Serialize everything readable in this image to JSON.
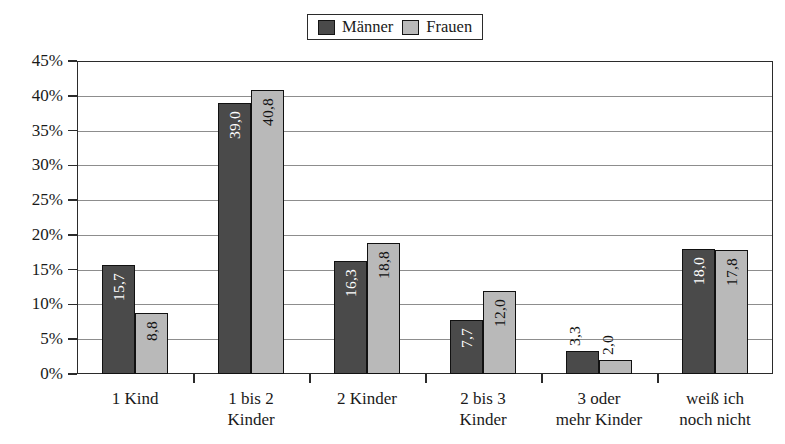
{
  "legend": {
    "entries": [
      {
        "label": "Männer",
        "color": "#4a4a4a"
      },
      {
        "label": "Frauen",
        "color": "#b9b9b9"
      }
    ]
  },
  "axis": {
    "y_ticks": [
      "0%",
      "5%",
      "10%",
      "15%",
      "20%",
      "25%",
      "30%",
      "35%",
      "40%",
      "45%"
    ]
  },
  "chart_data": {
    "type": "bar",
    "title": "",
    "xlabel": "",
    "ylabel": "",
    "ylim": [
      0,
      45
    ],
    "ytick_step": 5,
    "grid": true,
    "legend_position": "top-center",
    "value_format": "comma-decimal",
    "categories": [
      "1 Kind",
      "1 bis 2\nKinder",
      "2 Kinder",
      "2 bis 3\nKinder",
      "3 oder\nmehr Kinder",
      "weiß ich\nnoch nicht"
    ],
    "series": [
      {
        "name": "Männer",
        "color": "#4a4a4a",
        "values": [
          15.7,
          39.0,
          16.3,
          7.7,
          3.3,
          18.0
        ],
        "labels": [
          "15,7",
          "39,0",
          "16,3",
          "7,7",
          "3,3",
          "18,0"
        ]
      },
      {
        "name": "Frauen",
        "color": "#b9b9b9",
        "values": [
          8.8,
          40.8,
          18.8,
          12.0,
          2.0,
          17.8
        ],
        "labels": [
          "8,8",
          "40,8",
          "18,8",
          "12,0",
          "2,0",
          "17,8"
        ]
      }
    ]
  }
}
